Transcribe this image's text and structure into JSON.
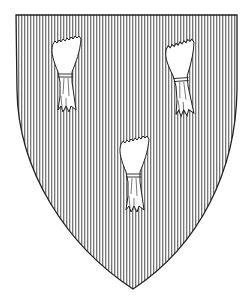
{
  "image": {
    "subject": "heraldic shield",
    "field_hatching": "vertical lines",
    "charges": [
      {
        "name": "garb",
        "position": "upper-left"
      },
      {
        "name": "garb",
        "position": "upper-right"
      },
      {
        "name": "garb",
        "position": "base"
      }
    ],
    "colors": {
      "line": "#222222",
      "background": "#ffffff"
    }
  }
}
